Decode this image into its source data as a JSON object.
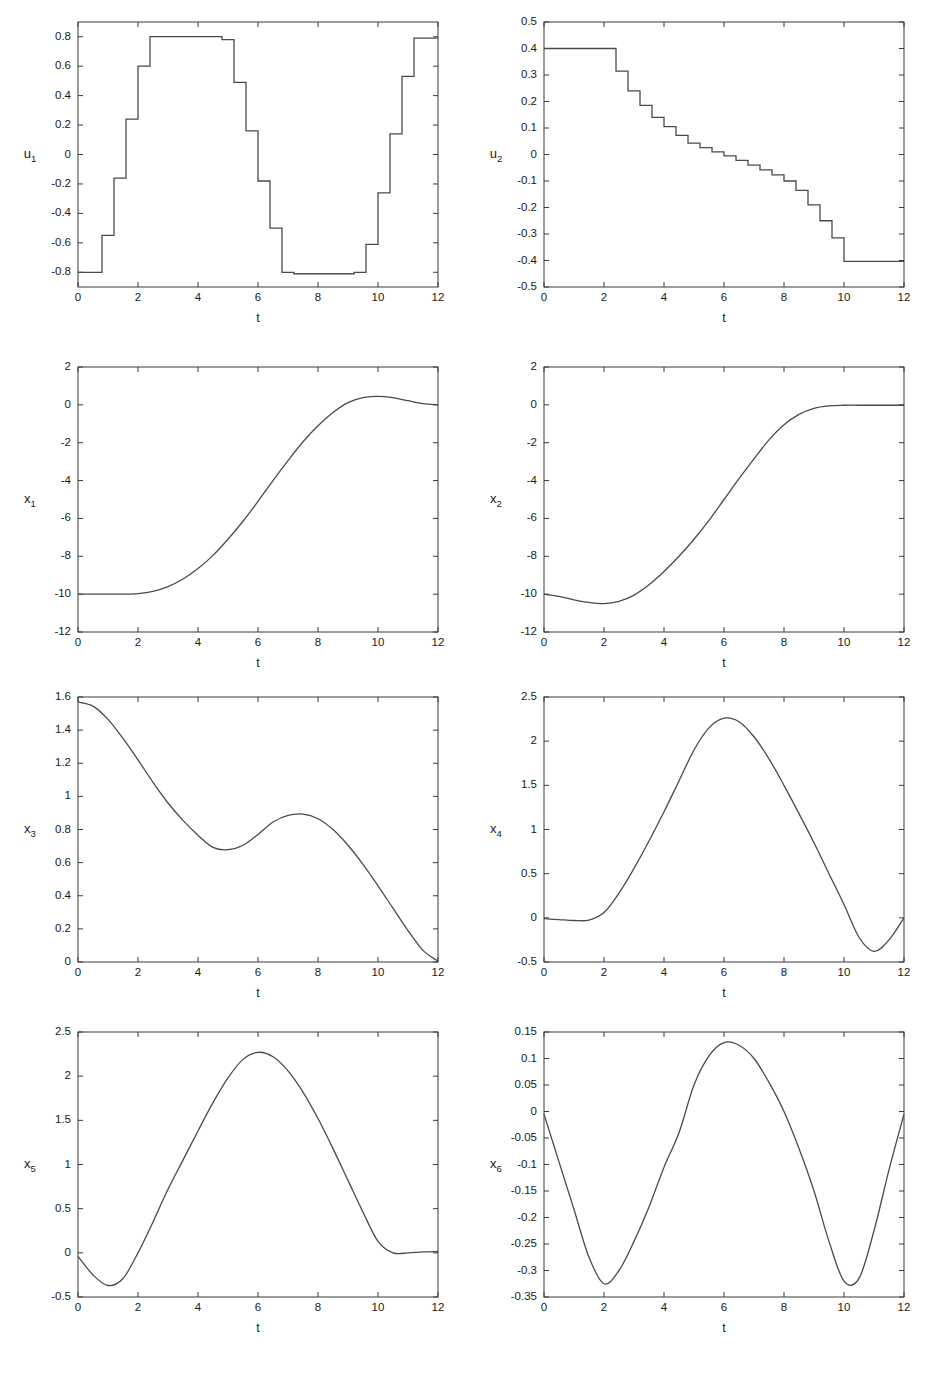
{
  "figure": {
    "background": "#ffffff",
    "line_color": "#4a4a4a",
    "axis_color": "#3a3a3a",
    "rows": 4,
    "cols": 2
  },
  "chart_data": [
    {
      "id": "u1",
      "type": "line",
      "style": "step",
      "title": "",
      "xlabel": "t",
      "ylabel": "u_1",
      "ylabel_base": "u",
      "ylabel_sub": "1",
      "xlim": [
        0,
        12
      ],
      "ylim": [
        -0.9,
        0.9
      ],
      "xticks": [
        0,
        2,
        4,
        6,
        8,
        10,
        12
      ],
      "xticklabels": [
        "0",
        "2",
        "4",
        "6",
        "8",
        "10",
        "12"
      ],
      "yticks": [
        0.8,
        0.6,
        0.4,
        0.2,
        0,
        -0.2,
        -0.4,
        -0.6,
        -0.8
      ],
      "yticklabels": [
        "0.8",
        "0.6",
        "0.4",
        "0.2",
        "0",
        "-0.2",
        "-0.4",
        "-0.6",
        "-0.8"
      ],
      "grid": false,
      "step_width": 0.4,
      "x": [
        0.0,
        0.4,
        0.8,
        1.2,
        1.6,
        2.0,
        2.4,
        2.8,
        3.2,
        3.6,
        4.0,
        4.4,
        4.8,
        5.2,
        5.6,
        6.0,
        6.4,
        6.8,
        7.2,
        7.6,
        8.0,
        8.4,
        8.8,
        9.2,
        9.6,
        10.0,
        10.4,
        10.8,
        11.2,
        11.6,
        12.0
      ],
      "values": [
        -0.8,
        -0.8,
        -0.55,
        -0.16,
        0.24,
        0.6,
        0.8,
        0.8,
        0.8,
        0.8,
        0.8,
        0.8,
        0.78,
        0.49,
        0.16,
        -0.18,
        -0.5,
        -0.8,
        -0.81,
        -0.81,
        -0.81,
        -0.81,
        -0.81,
        -0.8,
        -0.61,
        -0.26,
        0.14,
        0.53,
        0.79,
        0.79
      ]
    },
    {
      "id": "u2",
      "type": "line",
      "style": "step",
      "title": "",
      "xlabel": "t",
      "ylabel": "u_2",
      "ylabel_base": "u",
      "ylabel_sub": "2",
      "xlim": [
        0,
        12
      ],
      "ylim": [
        -0.5,
        0.5
      ],
      "xticks": [
        0,
        2,
        4,
        6,
        8,
        10,
        12
      ],
      "xticklabels": [
        "0",
        "2",
        "4",
        "6",
        "8",
        "10",
        "12"
      ],
      "yticks": [
        0.5,
        0.4,
        0.3,
        0.2,
        0.1,
        0,
        -0.1,
        -0.2,
        -0.3,
        -0.4,
        -0.5
      ],
      "yticklabels": [
        "0.5",
        "0.4",
        "0.3",
        "0.2",
        "0.1",
        "0",
        "-0.1",
        "-0.2",
        "-0.3",
        "-0.4",
        "-0.5"
      ],
      "grid": false,
      "step_width": 0.4,
      "x": [
        0.0,
        0.4,
        0.8,
        1.2,
        1.6,
        2.0,
        2.4,
        2.8,
        3.2,
        3.6,
        4.0,
        4.4,
        4.8,
        5.2,
        5.6,
        6.0,
        6.4,
        6.8,
        7.2,
        7.6,
        8.0,
        8.4,
        8.8,
        9.2,
        9.6,
        10.0,
        10.4,
        10.8,
        11.2,
        11.6,
        12.0
      ],
      "values": [
        0.4,
        0.4,
        0.4,
        0.4,
        0.4,
        0.4,
        0.315,
        0.24,
        0.185,
        0.14,
        0.105,
        0.072,
        0.043,
        0.026,
        0.01,
        -0.005,
        -0.022,
        -0.04,
        -0.058,
        -0.077,
        -0.1,
        -0.135,
        -0.19,
        -0.25,
        -0.315,
        -0.403,
        -0.403,
        -0.403,
        -0.403,
        -0.403
      ]
    },
    {
      "id": "x1",
      "type": "line",
      "style": "smooth",
      "title": "",
      "xlabel": "t",
      "ylabel": "x_1",
      "ylabel_base": "x",
      "ylabel_sub": "1",
      "xlim": [
        0,
        12
      ],
      "ylim": [
        -12,
        2
      ],
      "xticks": [
        0,
        2,
        4,
        6,
        8,
        10,
        12
      ],
      "xticklabels": [
        "0",
        "2",
        "4",
        "6",
        "8",
        "10",
        "12"
      ],
      "yticks": [
        2,
        0,
        -2,
        -4,
        -6,
        -8,
        -10,
        -12
      ],
      "yticklabels": [
        "2",
        "0",
        "-2",
        "-4",
        "-6",
        "-8",
        "-10",
        "-12"
      ],
      "grid": false,
      "x": [
        0,
        0.5,
        1,
        1.5,
        2,
        2.5,
        3,
        3.5,
        4,
        4.5,
        5,
        5.5,
        6,
        6.5,
        7,
        7.5,
        8,
        8.5,
        9,
        9.5,
        10,
        10.5,
        11,
        11.5,
        12
      ],
      "values": [
        -10.0,
        -10.0,
        -10.0,
        -10.0,
        -9.97,
        -9.85,
        -9.6,
        -9.2,
        -8.65,
        -7.95,
        -7.1,
        -6.15,
        -5.1,
        -4.0,
        -2.95,
        -1.95,
        -1.1,
        -0.4,
        0.12,
        0.38,
        0.45,
        0.38,
        0.22,
        0.07,
        0.0
      ]
    },
    {
      "id": "x2",
      "type": "line",
      "style": "smooth",
      "title": "",
      "xlabel": "t",
      "ylabel": "x_2",
      "ylabel_base": "x",
      "ylabel_sub": "2",
      "xlim": [
        0,
        12
      ],
      "ylim": [
        -12,
        2
      ],
      "xticks": [
        0,
        2,
        4,
        6,
        8,
        10,
        12
      ],
      "xticklabels": [
        "0",
        "2",
        "4",
        "6",
        "8",
        "10",
        "12"
      ],
      "yticks": [
        2,
        0,
        -2,
        -4,
        -6,
        -8,
        -10,
        -12
      ],
      "yticklabels": [
        "2",
        "0",
        "-2",
        "-4",
        "-6",
        "-8",
        "-10",
        "-12"
      ],
      "grid": false,
      "x": [
        0,
        0.5,
        1,
        1.5,
        2,
        2.5,
        3,
        3.5,
        4,
        4.5,
        5,
        5.5,
        6,
        6.5,
        7,
        7.5,
        8,
        8.5,
        9,
        9.5,
        10,
        10.5,
        11,
        11.5,
        12
      ],
      "values": [
        -10.0,
        -10.12,
        -10.3,
        -10.44,
        -10.5,
        -10.38,
        -10.05,
        -9.5,
        -8.8,
        -8.0,
        -7.1,
        -6.1,
        -5.0,
        -3.9,
        -2.85,
        -1.85,
        -1.05,
        -0.5,
        -0.18,
        -0.05,
        -0.02,
        -0.02,
        -0.02,
        -0.02,
        -0.02
      ]
    },
    {
      "id": "x3",
      "type": "line",
      "style": "smooth",
      "title": "",
      "xlabel": "t",
      "ylabel": "x_3",
      "ylabel_base": "x",
      "ylabel_sub": "3",
      "xlim": [
        0,
        12
      ],
      "ylim": [
        0,
        1.6
      ],
      "xticks": [
        0,
        2,
        4,
        6,
        8,
        10,
        12
      ],
      "xticklabels": [
        "0",
        "2",
        "4",
        "6",
        "8",
        "10",
        "12"
      ],
      "yticks": [
        1.6,
        1.4,
        1.2,
        1,
        0.8,
        0.6,
        0.4,
        0.2,
        0
      ],
      "yticklabels": [
        "1.6",
        "1.4",
        "1.2",
        "1",
        "0.8",
        "0.6",
        "0.4",
        "0.2",
        "0"
      ],
      "grid": false,
      "x": [
        0,
        0.5,
        1,
        1.5,
        2,
        2.5,
        3,
        3.5,
        4,
        4.5,
        5,
        5.5,
        6,
        6.5,
        7,
        7.5,
        8,
        8.5,
        9,
        9.5,
        10,
        10.5,
        11,
        11.5,
        12
      ],
      "values": [
        1.57,
        1.545,
        1.465,
        1.35,
        1.22,
        1.085,
        0.96,
        0.855,
        0.765,
        0.692,
        0.678,
        0.705,
        0.77,
        0.845,
        0.885,
        0.893,
        0.865,
        0.8,
        0.705,
        0.59,
        0.46,
        0.325,
        0.19,
        0.07,
        0.005
      ]
    },
    {
      "id": "x4",
      "type": "line",
      "style": "smooth",
      "title": "",
      "xlabel": "t",
      "ylabel": "x_4",
      "ylabel_base": "x",
      "ylabel_sub": "4",
      "xlim": [
        0,
        12
      ],
      "ylim": [
        -0.5,
        2.5
      ],
      "xticks": [
        0,
        2,
        4,
        6,
        8,
        10,
        12
      ],
      "xticklabels": [
        "0",
        "2",
        "4",
        "6",
        "8",
        "10",
        "12"
      ],
      "yticks": [
        2.5,
        2,
        1.5,
        1,
        0.5,
        0,
        -0.5
      ],
      "yticklabels": [
        "2.5",
        "2",
        "1.5",
        "1",
        "0.5",
        "0",
        "-0.5"
      ],
      "grid": false,
      "x": [
        0,
        0.5,
        1,
        1.5,
        2,
        2.5,
        3,
        3.5,
        4,
        4.5,
        5,
        5.5,
        6,
        6.5,
        7,
        7.5,
        8,
        8.5,
        9,
        9.5,
        10,
        10.5,
        11,
        11.5,
        12
      ],
      "values": [
        -0.01,
        -0.02,
        -0.03,
        -0.025,
        0.06,
        0.28,
        0.56,
        0.87,
        1.2,
        1.55,
        1.9,
        2.15,
        2.26,
        2.22,
        2.05,
        1.8,
        1.5,
        1.18,
        0.85,
        0.5,
        0.15,
        -0.22,
        -0.38,
        -0.25,
        0.0
      ]
    },
    {
      "id": "x5",
      "type": "line",
      "style": "smooth",
      "title": "",
      "xlabel": "t",
      "ylabel": "x_5",
      "ylabel_base": "x",
      "ylabel_sub": "5",
      "xlim": [
        0,
        12
      ],
      "ylim": [
        -0.5,
        2.5
      ],
      "xticks": [
        0,
        2,
        4,
        6,
        8,
        10,
        12
      ],
      "xticklabels": [
        "0",
        "2",
        "4",
        "6",
        "8",
        "10",
        "12"
      ],
      "yticks": [
        2.5,
        2,
        1.5,
        1,
        0.5,
        0,
        -0.5
      ],
      "yticklabels": [
        "2.5",
        "2",
        "1.5",
        "1",
        "0.5",
        "0",
        "-0.5"
      ],
      "grid": false,
      "x": [
        0,
        0.5,
        1,
        1.5,
        2,
        2.5,
        3,
        3.5,
        4,
        4.5,
        5,
        5.5,
        6,
        6.5,
        7,
        7.5,
        8,
        8.5,
        9,
        9.5,
        10,
        10.5,
        11,
        11.5,
        12
      ],
      "values": [
        -0.04,
        -0.25,
        -0.37,
        -0.29,
        0.0,
        0.35,
        0.72,
        1.05,
        1.38,
        1.7,
        1.98,
        2.19,
        2.27,
        2.22,
        2.06,
        1.82,
        1.52,
        1.18,
        0.82,
        0.46,
        0.13,
        0.0,
        0.0,
        0.01,
        0.015
      ]
    },
    {
      "id": "x6",
      "type": "line",
      "style": "smooth",
      "title": "",
      "xlabel": "t",
      "ylabel": "x_6",
      "ylabel_base": "x",
      "ylabel_sub": "6",
      "xlim": [
        0,
        12
      ],
      "ylim": [
        -0.35,
        0.15
      ],
      "xticks": [
        0,
        2,
        4,
        6,
        8,
        10,
        12
      ],
      "xticklabels": [
        "0",
        "2",
        "4",
        "6",
        "8",
        "10",
        "12"
      ],
      "yticks": [
        0.15,
        0.1,
        0.05,
        0,
        -0.05,
        -0.1,
        -0.15,
        -0.2,
        -0.25,
        -0.3,
        -0.35
      ],
      "yticklabels": [
        "0.15",
        "0.1",
        "0.05",
        "0",
        "-0.05",
        "-0.1",
        "-0.15",
        "-0.2",
        "-0.25",
        "-0.3",
        "-0.35"
      ],
      "grid": false,
      "x": [
        0,
        0.5,
        1,
        1.5,
        2,
        2.5,
        3,
        3.5,
        4,
        4.5,
        5,
        5.5,
        6,
        6.5,
        7,
        7.5,
        8,
        8.5,
        9,
        9.5,
        10,
        10.5,
        11,
        11.5,
        12
      ],
      "values": [
        -0.005,
        -0.095,
        -0.185,
        -0.275,
        -0.325,
        -0.3,
        -0.245,
        -0.18,
        -0.105,
        -0.04,
        0.05,
        0.105,
        0.13,
        0.125,
        0.1,
        0.055,
        0.0,
        -0.07,
        -0.15,
        -0.245,
        -0.32,
        -0.315,
        -0.225,
        -0.11,
        -0.005
      ]
    }
  ]
}
